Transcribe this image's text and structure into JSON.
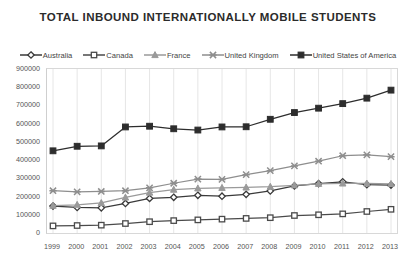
{
  "chart_data": {
    "type": "line",
    "title": "TOTAL INBOUND INTERNATIONALLY MOBILE STUDENTS",
    "xlabel": "",
    "ylabel": "",
    "x": [
      1999,
      2000,
      2001,
      2002,
      2003,
      2004,
      2005,
      2006,
      2007,
      2008,
      2009,
      2010,
      2011,
      2012,
      2013
    ],
    "categories": [
      "1999",
      "2000",
      "2001",
      "2002",
      "2003",
      "2004",
      "2005",
      "2006",
      "2007",
      "2008",
      "2009",
      "2010",
      "2011",
      "2012",
      "2013"
    ],
    "ylim": [
      0,
      900000
    ],
    "yticks": [
      0,
      100000,
      200000,
      300000,
      400000,
      500000,
      600000,
      700000,
      800000,
      900000
    ],
    "ytick_labels": [
      "0",
      "100000",
      "200000",
      "300000",
      "400000",
      "500000",
      "600000",
      "700000",
      "800000",
      "900000"
    ],
    "grid": "vertical",
    "legend_position": "top",
    "series": [
      {
        "name": "Australia",
        "marker": "diamond",
        "color": "#3a3a3a",
        "values": [
          148000,
          140000,
          138000,
          162000,
          190000,
          196000,
          207000,
          202000,
          212000,
          231000,
          258000,
          271000,
          281000,
          265000,
          263000
        ]
      },
      {
        "name": "Canada",
        "marker": "square",
        "color": "#4a4a4a",
        "values": [
          39000,
          41000,
          43000,
          52000,
          62000,
          68000,
          72000,
          76000,
          80000,
          84000,
          96000,
          100000,
          105000,
          118000,
          130000
        ]
      },
      {
        "name": "France",
        "marker": "triangle",
        "color": "#9a9a9a",
        "values": [
          150000,
          155000,
          165000,
          195000,
          222000,
          238000,
          245000,
          248000,
          250000,
          254000,
          262000,
          270000,
          272000,
          272000,
          270000
        ]
      },
      {
        "name": "United Kingdom",
        "marker": "x",
        "color": "#8e8e8e",
        "values": [
          232000,
          226000,
          228000,
          232000,
          248000,
          273000,
          296000,
          294000,
          320000,
          342000,
          368000,
          394000,
          424000,
          429000,
          419000
        ]
      },
      {
        "name": "United States of America",
        "marker": "square-filled",
        "color": "#2d2d2d",
        "values": [
          451000,
          476000,
          478000,
          582000,
          586000,
          572000,
          565000,
          582000,
          583000,
          624000,
          661000,
          685000,
          710000,
          740000,
          784000
        ]
      }
    ]
  }
}
